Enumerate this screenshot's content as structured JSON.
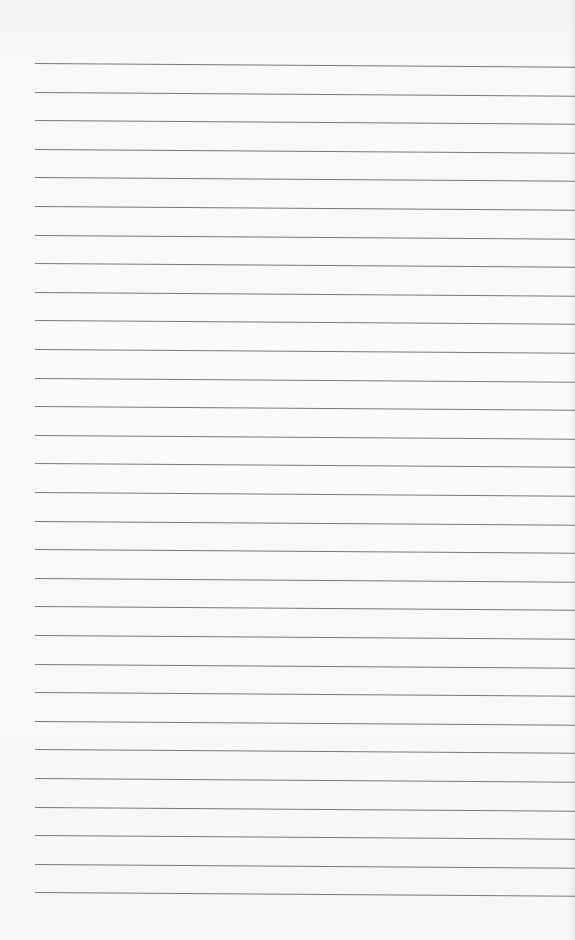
{
  "page": {
    "type": "lined-paper",
    "background_color": "#f8f8f8",
    "rule_color": "#7a7a7a",
    "rule_count": 30,
    "first_rule_y": 63,
    "rule_spacing": 28.6,
    "rule_left_x": 35,
    "text_lines": []
  }
}
